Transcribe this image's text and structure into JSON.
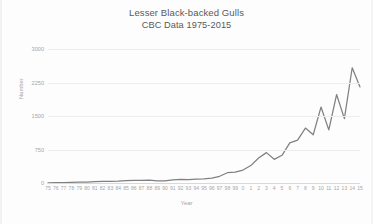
{
  "chart_data": {
    "type": "line",
    "title": "Lesser Black-backed Gulls",
    "subtitle": "CBC Data 1975-2015",
    "xlabel": "Year",
    "ylabel": "Number",
    "ylim": [
      0,
      3000
    ],
    "yticks": [
      0,
      750,
      1500,
      2250,
      3000
    ],
    "grid": true,
    "legend": "none",
    "line_color": "#808080",
    "categories": [
      "75",
      "76",
      "77",
      "78",
      "79",
      "80",
      "81",
      "82",
      "83",
      "84",
      "85",
      "86",
      "87",
      "88",
      "89",
      "90",
      "91",
      "92",
      "93",
      "94",
      "95",
      "96",
      "97",
      "98",
      "99",
      "0",
      "1",
      "2",
      "3",
      "4",
      "5",
      "6",
      "7",
      "8",
      "9",
      "10",
      "11",
      "12",
      "13",
      "14",
      "15"
    ],
    "values": [
      5,
      8,
      10,
      14,
      18,
      22,
      30,
      38,
      34,
      40,
      52,
      60,
      58,
      62,
      48,
      45,
      70,
      80,
      78,
      88,
      95,
      110,
      150,
      230,
      245,
      290,
      390,
      560,
      680,
      530,
      620,
      900,
      960,
      1230,
      1080,
      1700,
      1190,
      1980,
      1440,
      2580,
      2150
    ],
    "yminor_axis_label": "Number"
  },
  "axis": {
    "y_ticks": [
      "0",
      "750",
      "1500",
      "2250",
      "3000"
    ],
    "y_title": "Number",
    "x_title": "Year"
  }
}
